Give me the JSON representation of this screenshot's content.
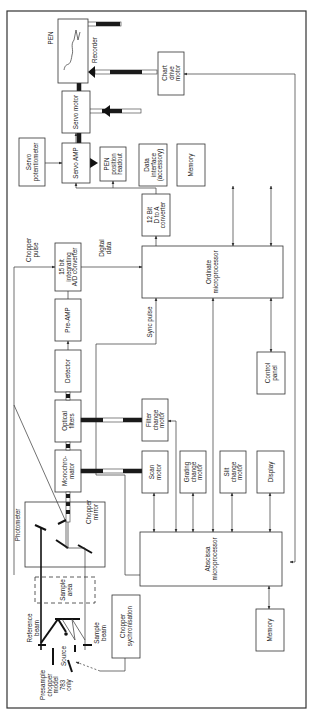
{
  "diagram": {
    "orientation": "rotated 90deg counter-clockwise",
    "blocks": {
      "photometer": "Photometer",
      "sample_area": [
        "Sample",
        "area"
      ],
      "reference_beam": [
        "Reference",
        "beam"
      ],
      "sample_beam": [
        "Sample",
        "beam"
      ],
      "source": "Source",
      "presample_chopper": [
        "Presample",
        "chopper",
        "model",
        "783",
        "only"
      ],
      "chopper_sync": [
        "Chopper",
        "sychronisation"
      ],
      "chopper_mirror": [
        "Chopper",
        "mirror"
      ],
      "monochromator": [
        "Monochro-",
        "mator"
      ],
      "optical_filters": [
        "Optical",
        "filters"
      ],
      "detector": "Detector",
      "preamp": "Pre-AMP",
      "ad_converter": [
        "15 bit",
        "integrating",
        "A/D converter"
      ],
      "chopper_pulse": [
        "Chopper",
        "pulse"
      ],
      "digital_data": [
        "Digital",
        "data"
      ],
      "servo_pot": [
        "Servo",
        "potentiometer"
      ],
      "pen": "PEN",
      "recorder": "Recorder",
      "chart_drive_motor": [
        "Chart",
        "drive",
        "motor"
      ],
      "servo_motor": "Servo motor",
      "servo_amp": "Servo AMP",
      "pen_position": [
        "PEN",
        "position",
        "readout"
      ],
      "data_interface": [
        "Data",
        "interface",
        "(accessory)"
      ],
      "memory_top": "Memory",
      "da_converter": [
        "12 Bit",
        "D to A",
        "converter"
      ],
      "ordinate_mp": [
        "Ordinate",
        "microprocessor"
      ],
      "sync_pulse": "Sync pulse",
      "control_panel": [
        "Control",
        "panel"
      ],
      "filter_change_motor": [
        "Filter",
        "change",
        "motor"
      ],
      "scan_motor": [
        "Scan",
        "motor"
      ],
      "grating_change_motor": [
        "Grating",
        "change",
        "motor"
      ],
      "slit_change_motor": [
        "Slit",
        "change",
        "motor"
      ],
      "display": "Display",
      "abscissa_mp": [
        "Abscissa",
        "microprocessor"
      ],
      "memory_bottom": "Memory"
    },
    "colors": {
      "line": "#333333",
      "shaft_dark": "#1a1a1a",
      "background": "#ffffff"
    }
  }
}
